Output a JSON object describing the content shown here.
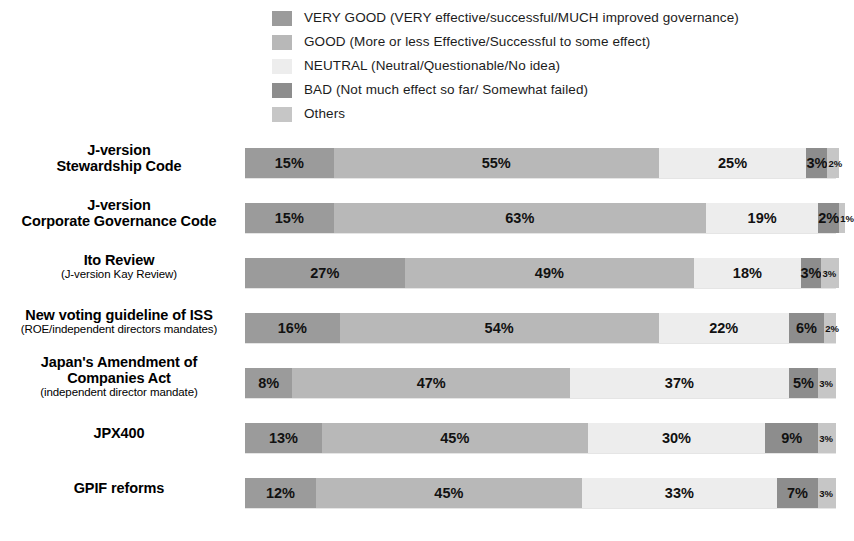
{
  "legend": {
    "items": [
      {
        "label": "VERY GOOD (VERY effective/successful/MUCH improved governance)",
        "color": "#9b9b9b",
        "key": "very_good"
      },
      {
        "label": "GOOD (More or less Effective/Successful to some effect)",
        "color": "#b8b8b8",
        "key": "good"
      },
      {
        "label": "NEUTRAL (Neutral/Questionable/No idea)",
        "color": "#ededed",
        "key": "neutral"
      },
      {
        "label": "BAD (Not much effect so far/ Somewhat failed)",
        "color": "#8d8d8d",
        "key": "bad"
      },
      {
        "label": "Others",
        "color": "#c6c6c6",
        "key": "others"
      }
    ]
  },
  "chart_data": {
    "type": "bar",
    "orientation": "horizontal",
    "stacked": true,
    "title": "",
    "xlabel": "",
    "ylabel": "",
    "xlim": [
      0,
      100
    ],
    "grid": false,
    "legend_position": "top",
    "value_suffix": "%",
    "categories": [
      "J-version Stewardship Code",
      "J-version Corporate Governance Code",
      "Ito Review (J-version Kay Review)",
      "New voting guideline of ISS (ROE/independent directors mandates)",
      "Japan's Amendment of Companies Act (independent director mandate)",
      "JPX400",
      "GPIF reforms"
    ],
    "series": [
      {
        "name": "VERY GOOD (VERY effective/successful/MUCH improved governance)",
        "color": "#9b9b9b",
        "values": [
          15,
          15,
          27,
          16,
          8,
          13,
          12
        ]
      },
      {
        "name": "GOOD (More or less Effective/Successful to some effect)",
        "color": "#b8b8b8",
        "values": [
          55,
          63,
          49,
          54,
          47,
          45,
          45
        ]
      },
      {
        "name": "NEUTRAL (Neutral/Questionable/No idea)",
        "color": "#ededed",
        "values": [
          25,
          19,
          18,
          22,
          37,
          30,
          33
        ]
      },
      {
        "name": "BAD (Not much effect so far/ Somewhat failed)",
        "color": "#8d8d8d",
        "values": [
          3,
          2,
          3,
          6,
          5,
          9,
          7
        ]
      },
      {
        "name": "Others",
        "color": "#c6c6c6",
        "values": [
          2,
          1,
          3,
          2,
          3,
          3,
          3
        ]
      }
    ]
  },
  "rows": [
    {
      "label_main_1": "J-version",
      "label_main_2": "Stewardship Code",
      "label_sub": "",
      "segments": [
        {
          "value": "15%",
          "pct": 15,
          "color": "#9b9b9b",
          "tiny": false
        },
        {
          "value": "55%",
          "pct": 55,
          "color": "#b8b8b8",
          "tiny": false
        },
        {
          "value": "25%",
          "pct": 25,
          "color": "#ededed",
          "tiny": false
        },
        {
          "value": "3%",
          "pct": 3,
          "color": "#8d8d8d",
          "tiny": false
        },
        {
          "value": "2%",
          "pct": 2,
          "color": "#c6c6c6",
          "tiny": true
        }
      ]
    },
    {
      "label_main_1": "J-version",
      "label_main_2": "Corporate Governance Code",
      "label_sub": "",
      "segments": [
        {
          "value": "15%",
          "pct": 15,
          "color": "#9b9b9b",
          "tiny": false
        },
        {
          "value": "63%",
          "pct": 63,
          "color": "#b8b8b8",
          "tiny": false
        },
        {
          "value": "19%",
          "pct": 19,
          "color": "#ededed",
          "tiny": false
        },
        {
          "value": "2%",
          "pct": 2,
          "color": "#8d8d8d",
          "tiny": false
        },
        {
          "value": "1%",
          "pct": 1,
          "color": "#c6c6c6",
          "tiny": true
        }
      ]
    },
    {
      "label_main_1": "Ito Review",
      "label_main_2": "",
      "label_sub": "(J-version Kay Review)",
      "segments": [
        {
          "value": "27%",
          "pct": 27,
          "color": "#9b9b9b",
          "tiny": false
        },
        {
          "value": "49%",
          "pct": 49,
          "color": "#b8b8b8",
          "tiny": false
        },
        {
          "value": "18%",
          "pct": 18,
          "color": "#ededed",
          "tiny": false
        },
        {
          "value": "3%",
          "pct": 3,
          "color": "#8d8d8d",
          "tiny": false
        },
        {
          "value": "3%",
          "pct": 3,
          "color": "#c6c6c6",
          "tiny": true
        }
      ]
    },
    {
      "label_main_1": "New voting guideline of ISS",
      "label_main_2": "",
      "label_sub": "(ROE/independent directors mandates)",
      "segments": [
        {
          "value": "16%",
          "pct": 16,
          "color": "#9b9b9b",
          "tiny": false
        },
        {
          "value": "54%",
          "pct": 54,
          "color": "#b8b8b8",
          "tiny": false
        },
        {
          "value": "22%",
          "pct": 22,
          "color": "#ededed",
          "tiny": false
        },
        {
          "value": "6%",
          "pct": 6,
          "color": "#8d8d8d",
          "tiny": false
        },
        {
          "value": "2%",
          "pct": 2,
          "color": "#c6c6c6",
          "tiny": true
        }
      ]
    },
    {
      "label_main_1": "Japan's Amendment of",
      "label_main_2": "Companies Act",
      "label_sub": "(independent director mandate)",
      "segments": [
        {
          "value": "8%",
          "pct": 8,
          "color": "#9b9b9b",
          "tiny": false
        },
        {
          "value": "47%",
          "pct": 47,
          "color": "#b8b8b8",
          "tiny": false
        },
        {
          "value": "37%",
          "pct": 37,
          "color": "#ededed",
          "tiny": false
        },
        {
          "value": "5%",
          "pct": 5,
          "color": "#8d8d8d",
          "tiny": false
        },
        {
          "value": "3%",
          "pct": 3,
          "color": "#c6c6c6",
          "tiny": true
        }
      ]
    },
    {
      "label_main_1": "JPX400",
      "label_main_2": "",
      "label_sub": "",
      "segments": [
        {
          "value": "13%",
          "pct": 13,
          "color": "#9b9b9b",
          "tiny": false
        },
        {
          "value": "45%",
          "pct": 45,
          "color": "#b8b8b8",
          "tiny": false
        },
        {
          "value": "30%",
          "pct": 30,
          "color": "#ededed",
          "tiny": false
        },
        {
          "value": "9%",
          "pct": 9,
          "color": "#8d8d8d",
          "tiny": false
        },
        {
          "value": "3%",
          "pct": 3,
          "color": "#c6c6c6",
          "tiny": true
        }
      ]
    },
    {
      "label_main_1": "GPIF reforms",
      "label_main_2": "",
      "label_sub": "",
      "segments": [
        {
          "value": "12%",
          "pct": 12,
          "color": "#9b9b9b",
          "tiny": false
        },
        {
          "value": "45%",
          "pct": 45,
          "color": "#b8b8b8",
          "tiny": false
        },
        {
          "value": "33%",
          "pct": 33,
          "color": "#ededed",
          "tiny": false
        },
        {
          "value": "7%",
          "pct": 7,
          "color": "#8d8d8d",
          "tiny": false
        },
        {
          "value": "3%",
          "pct": 3,
          "color": "#c6c6c6",
          "tiny": true
        }
      ]
    }
  ]
}
